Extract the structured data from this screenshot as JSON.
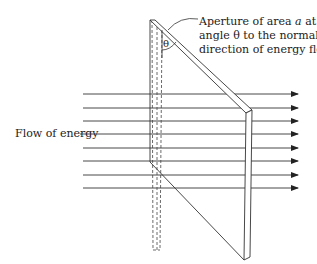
{
  "caption": {
    "line1_pre": "Aperture of area ",
    "line1_var": "a",
    "line1_post": " at an",
    "line2": "angle θ to the normal to",
    "line3": "direction of energy flow"
  },
  "angle_label": "θ",
  "flow_label": "Flow of energy",
  "colors": {
    "line": "#333333",
    "background": "#ffffff"
  },
  "arrows": {
    "count": 8,
    "x_start": 83,
    "x_end": 298,
    "y": [
      94,
      108,
      121,
      134,
      148,
      161,
      175,
      188
    ]
  }
}
